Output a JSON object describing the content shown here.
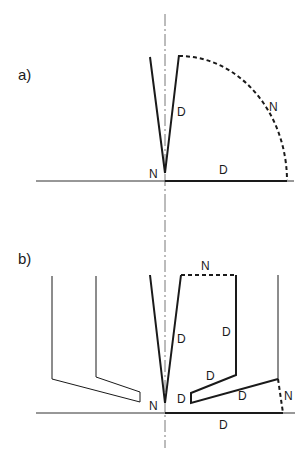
{
  "panels": [
    {
      "id": "a",
      "label": "a)",
      "annotations": {
        "wedge_face": "D",
        "arc": "N",
        "baseline": "D",
        "tip": "N"
      }
    },
    {
      "id": "b",
      "label": "b)",
      "annotations": {
        "top_dashed": "N",
        "wedge_face": "D",
        "right_wall": "D",
        "slope_upper": "D",
        "notch": "D",
        "slope_lower": "D",
        "side_dashed": "N",
        "baseline": "D",
        "tip": "N"
      }
    }
  ],
  "colors": {
    "line": "#1a1a1a",
    "axis": "#555555"
  }
}
